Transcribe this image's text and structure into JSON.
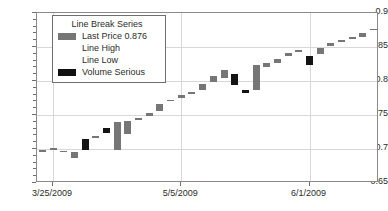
{
  "chart_data": {
    "type": "bar",
    "title": "",
    "subtitle": "",
    "xlabel": "",
    "ylabel": "",
    "ylim": [
      0.65,
      0.9
    ],
    "ytick_labels": [
      "0.65",
      "0.7",
      "0.75",
      "0.8",
      "0.85",
      "0.9"
    ],
    "ytick_values": [
      0.65,
      0.7,
      0.75,
      0.8,
      0.85,
      0.9
    ],
    "yminor_step": 0.01,
    "grid": true,
    "grid_axis": "both",
    "legend_position": "top-left",
    "xtick_labels": [
      "3/25/2009",
      "5/5/2009",
      "6/1/2009",
      "9/4/2009"
    ],
    "xtick_index": [
      1,
      13,
      25,
      37
    ],
    "colors": {
      "up": "#767676",
      "down": "#141414",
      "grid": "#d8d8d8",
      "frame": "#8a8a8a",
      "text": "#2b2b2b"
    },
    "series_name": "Line Break Series",
    "bars": [
      {
        "index": 0,
        "open": 0.6975,
        "close": 0.698,
        "direction": "up"
      },
      {
        "index": 1,
        "open": 0.698,
        "close": 0.7008,
        "direction": "up"
      },
      {
        "index": 2,
        "open": 0.6975,
        "close": 0.6955,
        "direction": "up"
      },
      {
        "index": 3,
        "open": 0.6955,
        "close": 0.6865,
        "direction": "up"
      },
      {
        "index": 4,
        "open": 0.714,
        "close": 0.699,
        "direction": "down"
      },
      {
        "index": 5,
        "open": 0.719,
        "close": 0.7165,
        "direction": "up"
      },
      {
        "index": 6,
        "open": 0.731,
        "close": 0.724,
        "direction": "down"
      },
      {
        "index": 7,
        "open": 0.739,
        "close": 0.6985,
        "direction": "up"
      },
      {
        "index": 8,
        "open": 0.7405,
        "close": 0.7225,
        "direction": "up"
      },
      {
        "index": 9,
        "open": 0.746,
        "close": 0.742,
        "direction": "up"
      },
      {
        "index": 10,
        "open": 0.753,
        "close": 0.749,
        "direction": "up"
      },
      {
        "index": 11,
        "open": 0.7665,
        "close": 0.756,
        "direction": "up"
      },
      {
        "index": 12,
        "open": 0.7725,
        "close": 0.77,
        "direction": "up"
      },
      {
        "index": 13,
        "open": 0.779,
        "close": 0.7755,
        "direction": "up"
      },
      {
        "index": 14,
        "open": 0.784,
        "close": 0.7805,
        "direction": "up"
      },
      {
        "index": 15,
        "open": 0.796,
        "close": 0.7865,
        "direction": "up"
      },
      {
        "index": 16,
        "open": 0.807,
        "close": 0.798,
        "direction": "up"
      },
      {
        "index": 17,
        "open": 0.8165,
        "close": 0.805,
        "direction": "up"
      },
      {
        "index": 18,
        "open": 0.8105,
        "close": 0.7935,
        "direction": "down"
      },
      {
        "index": 19,
        "open": 0.787,
        "close": 0.782,
        "direction": "down"
      },
      {
        "index": 20,
        "open": 0.823,
        "close": 0.7865,
        "direction": "up"
      },
      {
        "index": 21,
        "open": 0.827,
        "close": 0.821,
        "direction": "up"
      },
      {
        "index": 22,
        "open": 0.8325,
        "close": 0.827,
        "direction": "up"
      },
      {
        "index": 23,
        "open": 0.841,
        "close": 0.837,
        "direction": "up"
      },
      {
        "index": 24,
        "open": 0.845,
        "close": 0.842,
        "direction": "up"
      },
      {
        "index": 25,
        "open": 0.8375,
        "close": 0.823,
        "direction": "down"
      },
      {
        "index": 26,
        "open": 0.8485,
        "close": 0.84,
        "direction": "up"
      },
      {
        "index": 27,
        "open": 0.8555,
        "close": 0.852,
        "direction": "up"
      },
      {
        "index": 28,
        "open": 0.8605,
        "close": 0.8575,
        "direction": "up"
      },
      {
        "index": 29,
        "open": 0.864,
        "close": 0.862,
        "direction": "up"
      },
      {
        "index": 30,
        "open": 0.871,
        "close": 0.865,
        "direction": "up"
      },
      {
        "index": 31,
        "open": 0.877,
        "close": 0.8745,
        "direction": "up"
      }
    ]
  },
  "legend": {
    "title": "Line Break Series",
    "rows": [
      {
        "swatch": "grey",
        "label": "Last Price 0.876"
      },
      {
        "swatch": "blank",
        "label": "Line High"
      },
      {
        "swatch": "blank",
        "label": "Line Low"
      },
      {
        "swatch": "black",
        "label": "Volume Serious"
      }
    ]
  }
}
